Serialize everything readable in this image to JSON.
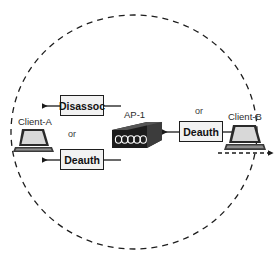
{
  "diagram": {
    "coverage_area": {
      "shape": "dashed-ellipse",
      "label": ""
    },
    "nodes": [
      {
        "id": "client-a",
        "label": "Client-A",
        "icon": "laptop-icon"
      },
      {
        "id": "ap-1",
        "label": "AP-1",
        "icon": "access-point-icon"
      },
      {
        "id": "client-b",
        "label": "Client-B",
        "icon": "laptop-icon"
      }
    ],
    "frames": [
      {
        "id": "disassoc-frame",
        "label": "Disassoc"
      },
      {
        "id": "deauth-frame-left",
        "label": "Deauth"
      },
      {
        "id": "deauth-frame-right",
        "label": "Deauth"
      }
    ],
    "connectors": [
      {
        "id": "or-left",
        "label": "or"
      },
      {
        "id": "or-right",
        "label": "or"
      }
    ],
    "colors": {
      "stroke": "#1e1e1e",
      "box_fill": "#f2f2f2",
      "device_dark": "#2a2a2a",
      "background": "#ffffff"
    }
  }
}
